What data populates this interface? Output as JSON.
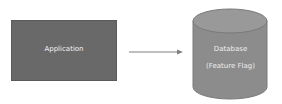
{
  "diagram": {
    "nodes": [
      {
        "id": "application",
        "shape": "rectangle",
        "label": "Application",
        "fill": "#696969"
      },
      {
        "id": "database",
        "shape": "cylinder",
        "label_line1": "Database",
        "label_line2": "(Feature Flag)",
        "fill": "#8c8c8c"
      }
    ],
    "edges": [
      {
        "from": "application",
        "to": "database",
        "type": "arrow",
        "color": "#7f7f7f"
      }
    ]
  }
}
